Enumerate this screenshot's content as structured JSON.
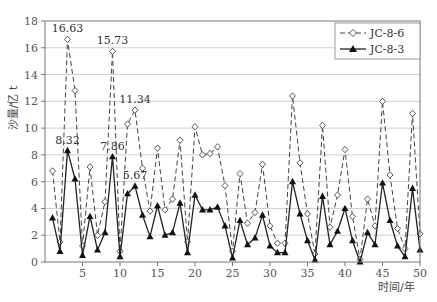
{
  "chart_data": {
    "type": "line",
    "title": "",
    "xlabel": "时间/年",
    "ylabel": "沙量/亿 t",
    "xlim": [
      0,
      50
    ],
    "ylim": [
      0,
      18
    ],
    "xticks": [
      5,
      10,
      15,
      20,
      25,
      30,
      35,
      40,
      45,
      50
    ],
    "yticks": [
      0,
      2,
      4,
      6,
      8,
      10,
      12,
      14,
      16,
      18
    ],
    "grid": true,
    "legend_position": "upper right",
    "x": [
      1,
      2,
      3,
      4,
      5,
      6,
      7,
      8,
      9,
      10,
      11,
      12,
      13,
      14,
      15,
      16,
      17,
      18,
      19,
      20,
      21,
      22,
      23,
      24,
      25,
      26,
      27,
      28,
      29,
      30,
      31,
      32,
      33,
      34,
      35,
      36,
      37,
      38,
      39,
      40,
      41,
      42,
      43,
      44,
      45,
      46,
      47,
      48,
      49,
      50
    ],
    "series": [
      {
        "name": "JC-8-6",
        "style": "dashed line, hollow diamond markers",
        "values": [
          6.8,
          1.5,
          16.63,
          12.8,
          1.2,
          7.1,
          2.0,
          4.5,
          15.73,
          0.8,
          10.3,
          11.34,
          7.0,
          3.8,
          8.5,
          3.9,
          4.7,
          9.1,
          1.5,
          10.1,
          8.0,
          8.1,
          8.6,
          5.7,
          0.8,
          6.6,
          2.9,
          3.7,
          7.3,
          2.7,
          1.4,
          1.4,
          12.4,
          7.4,
          3.6,
          0.6,
          10.2,
          2.6,
          5.0,
          8.4,
          3.4,
          0.2,
          4.7,
          2.7,
          12.0,
          6.5,
          2.5,
          1.0,
          11.1,
          2.1
        ]
      },
      {
        "name": "JC-8-3",
        "style": "solid line, filled triangle markers",
        "values": [
          3.3,
          0.8,
          8.32,
          6.2,
          0.5,
          3.4,
          0.9,
          2.2,
          7.86,
          0.4,
          5.1,
          5.67,
          3.5,
          1.9,
          4.2,
          2.0,
          2.2,
          4.4,
          0.7,
          5.0,
          3.9,
          3.9,
          4.1,
          2.7,
          0.3,
          3.1,
          1.3,
          1.8,
          3.5,
          1.2,
          0.7,
          0.7,
          6.0,
          3.6,
          1.6,
          0.15,
          4.9,
          1.3,
          2.3,
          4.0,
          1.6,
          0.0,
          2.2,
          1.3,
          5.9,
          3.1,
          1.2,
          0.4,
          5.5,
          0.9
        ]
      }
    ],
    "annotations": [
      {
        "text": "16.63",
        "x": 3,
        "y": 16.63
      },
      {
        "text": "15.73",
        "x": 9,
        "y": 15.73
      },
      {
        "text": "11.34",
        "x": 12,
        "y": 11.34
      },
      {
        "text": "8.32",
        "x": 3,
        "y": 8.32
      },
      {
        "text": "7.86",
        "x": 9,
        "y": 7.86
      },
      {
        "text": "5.67",
        "x": 12,
        "y": 5.67
      }
    ]
  },
  "legend": {
    "items": [
      {
        "label": "JC-8-6"
      },
      {
        "label": "JC-8-3"
      }
    ]
  },
  "axes": {
    "xlabel": "时间/年",
    "ylabel": "沙量/亿 t"
  }
}
